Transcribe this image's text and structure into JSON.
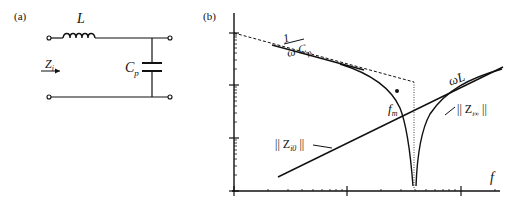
{
  "panel_a": {
    "label": "(a)",
    "inductor_label": "L",
    "capacitor_label": "C",
    "capacitor_sub": "p",
    "impedance_label": "Z",
    "impedance_sub": "i"
  },
  "panel_b": {
    "label": "(b)",
    "asymptote_cap_num": "1",
    "asymptote_cap_den": "ω C",
    "asymptote_cap_den_sub": "p",
    "asymptote_ind_label": "ωL",
    "curve_zi0_label": "|| Z",
    "curve_zi0_sub": "i0",
    "curve_zi0_end": " ||",
    "curve_ziinf_label": "|| Z",
    "curve_ziinf_sub": "i∞",
    "curve_ziinf_end": " ||",
    "fm_label": "f",
    "fm_sub": "m",
    "x_axis_label": "f"
  },
  "colors": {
    "ink": "#111111",
    "background": "#ffffff"
  }
}
